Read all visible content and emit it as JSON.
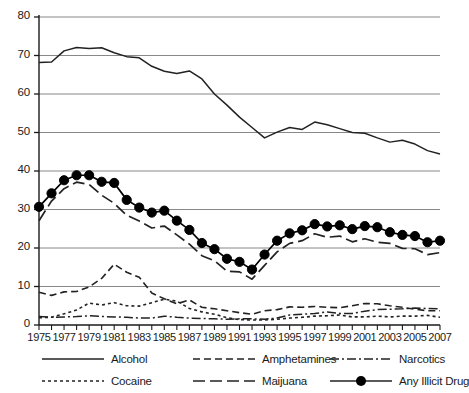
{
  "chart_data": {
    "type": "line",
    "title": "",
    "xlabel": "",
    "ylabel": "",
    "xlim": [
      1975,
      2007
    ],
    "ylim": [
      0,
      80
    ],
    "ytick_step": 10,
    "yticks": [
      0,
      10,
      20,
      30,
      40,
      50,
      60,
      70,
      80
    ],
    "xticks": [
      1975,
      1976,
      1977,
      1978,
      1979,
      1980,
      1981,
      1982,
      1983,
      1984,
      1985,
      1986,
      1987,
      1988,
      1989,
      1990,
      1991,
      1992,
      1993,
      1994,
      1995,
      1996,
      1997,
      1998,
      1999,
      2000,
      2001,
      2002,
      2003,
      2004,
      2005,
      2006,
      2007
    ],
    "xtick_labels": [
      "1975",
      "1977",
      "1979",
      "1981",
      "1983",
      "1985",
      "1987",
      "1989",
      "1991",
      "1993",
      "1995",
      "1997",
      "1999",
      "2001",
      "2003",
      "2005",
      "2007"
    ],
    "xtick_label_years": [
      1975,
      1977,
      1979,
      1981,
      1983,
      1985,
      1987,
      1989,
      1991,
      1993,
      1995,
      1997,
      1999,
      2001,
      2003,
      2005,
      2007
    ],
    "grid": "horizontal",
    "legend_position": "bottom",
    "x": [
      1975,
      1976,
      1977,
      1978,
      1979,
      1980,
      1981,
      1982,
      1983,
      1984,
      1985,
      1986,
      1987,
      1988,
      1989,
      1990,
      1991,
      1992,
      1993,
      1994,
      1995,
      1996,
      1997,
      1998,
      1999,
      2000,
      2001,
      2002,
      2003,
      2004,
      2005,
      2006,
      2007
    ],
    "series": [
      {
        "name": "Alcohol",
        "style": "solid",
        "color": "#222222",
        "marker": "none",
        "values": [
          68.2,
          68.3,
          71.2,
          72.1,
          71.8,
          72.0,
          70.7,
          69.7,
          69.4,
          67.2,
          65.9,
          65.3,
          66.0,
          63.9,
          60.0,
          57.1,
          54.0,
          51.3,
          48.6,
          50.1,
          51.3,
          50.8,
          52.7,
          52.0,
          51.0,
          50.0,
          49.8,
          48.6,
          47.5,
          48.0,
          47.0,
          45.3,
          44.4
        ]
      },
      {
        "name": "Amphetamines",
        "style": "dashed",
        "color": "#222222",
        "marker": "none",
        "values": [
          8.5,
          7.7,
          8.6,
          8.7,
          9.9,
          12.1,
          15.8,
          13.7,
          12.4,
          8.3,
          6.8,
          5.5,
          6.5,
          4.6,
          4.2,
          3.7,
          3.2,
          2.8,
          3.7,
          4.0,
          4.7,
          4.6,
          4.8,
          4.6,
          4.5,
          5.0,
          5.6,
          5.5,
          5.0,
          4.6,
          4.1,
          3.7,
          3.7
        ]
      },
      {
        "name": "Narcotics",
        "style": "dashdot",
        "color": "#222222",
        "marker": "none",
        "values": [
          2.2,
          2.0,
          2.1,
          2.2,
          2.4,
          2.2,
          2.1,
          2.0,
          1.8,
          1.8,
          2.3,
          2.0,
          1.8,
          1.7,
          1.6,
          1.5,
          1.6,
          1.6,
          1.5,
          1.8,
          2.6,
          2.8,
          3.0,
          3.4,
          3.0,
          3.0,
          3.6,
          4.0,
          4.1,
          4.2,
          4.4,
          4.3,
          4.2
        ]
      },
      {
        "name": "Cocaine",
        "style": "dotted",
        "color": "#222222",
        "marker": "none",
        "values": [
          1.9,
          2.0,
          2.9,
          3.9,
          5.7,
          5.2,
          5.8,
          5.0,
          4.9,
          5.8,
          6.7,
          6.2,
          4.3,
          3.4,
          2.8,
          1.9,
          1.4,
          1.3,
          1.3,
          1.5,
          1.8,
          2.0,
          2.3,
          2.4,
          2.6,
          2.1,
          2.1,
          2.3,
          2.1,
          2.3,
          2.3,
          2.5,
          2.0
        ]
      },
      {
        "name": "Maijuana",
        "style": "longdash",
        "color": "#222222",
        "marker": "none",
        "values": [
          27.1,
          32.2,
          35.4,
          37.1,
          36.5,
          33.7,
          31.6,
          28.5,
          27.0,
          25.2,
          25.7,
          23.4,
          21.0,
          18.0,
          16.7,
          14.0,
          13.8,
          11.9,
          15.5,
          19.0,
          21.2,
          21.9,
          23.7,
          22.8,
          23.1,
          21.6,
          22.4,
          21.5,
          21.2,
          19.9,
          19.8,
          18.3,
          18.8
        ]
      },
      {
        "name": "Any Illicit Drug",
        "style": "solid-marker",
        "color": "#000000",
        "marker": "circle",
        "values": [
          30.7,
          34.2,
          37.6,
          38.9,
          38.9,
          37.2,
          36.9,
          32.5,
          30.5,
          29.2,
          29.7,
          27.1,
          24.7,
          21.3,
          19.7,
          17.2,
          16.4,
          14.4,
          18.3,
          21.9,
          23.8,
          24.6,
          26.2,
          25.6,
          25.9,
          24.9,
          25.7,
          25.4,
          24.1,
          23.4,
          23.1,
          21.5,
          21.9
        ]
      }
    ]
  },
  "legend": {
    "items": [
      {
        "label": "Alcohol",
        "style": "solid"
      },
      {
        "label": "Amphetamines",
        "style": "dashed"
      },
      {
        "label": "Narcotics",
        "style": "dashdot"
      },
      {
        "label": "Cocaine",
        "style": "dotted"
      },
      {
        "label": "Maijuana",
        "style": "longdash"
      },
      {
        "label": "Any Illicit Drug",
        "style": "solid-marker"
      }
    ]
  },
  "axis": {
    "y_tick_labels": [
      "0",
      "10",
      "20",
      "30",
      "40",
      "50",
      "60",
      "70",
      "80"
    ],
    "x_tick_labels": [
      "1975",
      "1977",
      "1979",
      "1981",
      "1983",
      "1985",
      "1987",
      "1989",
      "1991",
      "1993",
      "1995",
      "1997",
      "1999",
      "2001",
      "2003",
      "2005",
      "2007"
    ]
  },
  "colors": {
    "ink": "#222222",
    "grid": "#888888",
    "background": "#ffffff"
  }
}
